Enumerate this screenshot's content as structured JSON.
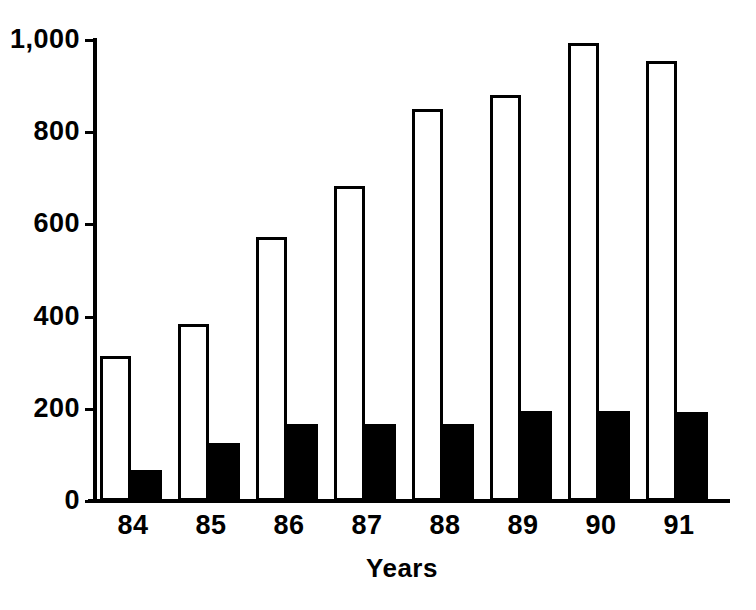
{
  "chart_data": {
    "type": "bar",
    "title": "",
    "subtitle": "",
    "xlabel": "Years",
    "ylabel": "",
    "categories": [
      "84",
      "85",
      "86",
      "87",
      "88",
      "89",
      "90",
      "91"
    ],
    "series": [
      {
        "name": "open-bars",
        "style": "open",
        "color": "#ffffff",
        "edge_color": "#000000",
        "values": [
          315,
          383,
          573,
          683,
          850,
          880,
          993,
          955
        ]
      },
      {
        "name": "filled-bars",
        "style": "filled",
        "color": "#000000",
        "edge_color": "#000000",
        "values": [
          67,
          125,
          168,
          168,
          168,
          195,
          195,
          193
        ]
      }
    ],
    "ylim": [
      0,
      1000
    ],
    "xlim": [
      0,
      8
    ],
    "y_ticks": [
      0,
      200,
      400,
      600,
      800,
      1000
    ],
    "y_tick_labels": [
      "0",
      "200",
      "400",
      "600",
      "800",
      "1,000"
    ],
    "grid": false,
    "legend": false,
    "legend_position": "none",
    "axis_color": "#000000",
    "background": "#ffffff"
  },
  "layout": {
    "plot_left": 97,
    "plot_right": 730,
    "plot_top": 40,
    "baseline_y": 501,
    "bar_width": 31,
    "group_pitch": 78,
    "group_start": 100
  }
}
